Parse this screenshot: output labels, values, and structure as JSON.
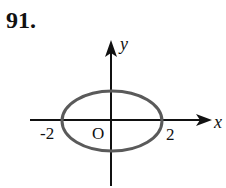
{
  "problem": {
    "number": "91."
  },
  "graph": {
    "type": "ellipse",
    "equation_hint": "x^2/4 + y^2/b^2 = 1",
    "axes": {
      "x_label": "x",
      "y_label": "y",
      "origin_label": "O"
    },
    "ticks": {
      "x_neg": "-2",
      "x_pos": "2"
    },
    "ellipse": {
      "center": [
        0,
        0
      ],
      "semi_major_x": 2,
      "stroke_color": "#5a5a5a"
    },
    "axis_color": "#111111"
  }
}
